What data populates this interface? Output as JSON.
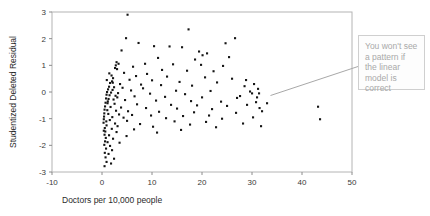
{
  "chart_data": {
    "type": "scatter",
    "title": "",
    "xlabel": "Doctors per 10,000 people",
    "ylabel": "Studentized Deleted Residual",
    "xlim": [
      -10,
      50
    ],
    "ylim": [
      -3,
      3
    ],
    "xticks": [
      "-10",
      "0",
      "10",
      "20",
      "30",
      "40",
      "50"
    ],
    "yticks": [
      "-3",
      "-2",
      "-1",
      "0",
      "1",
      "2",
      "3"
    ],
    "xtick_values": [
      -10,
      0,
      10,
      20,
      30,
      40,
      50
    ],
    "ytick_values": [
      -3,
      -2,
      -1,
      0,
      1,
      2,
      3
    ],
    "grid": false,
    "legend": null,
    "marker": "square",
    "marker_color": "#151515",
    "frame_color": "#b4b4b4",
    "points": [
      [
        5.1,
        2.9
      ],
      [
        17.3,
        2.35
      ],
      [
        4.8,
        2.02
      ],
      [
        26.6,
        2.02
      ],
      [
        7.3,
        1.84
      ],
      [
        24.7,
        1.83
      ],
      [
        10.4,
        1.72
      ],
      [
        13.5,
        1.71
      ],
      [
        16.0,
        1.68
      ],
      [
        3.9,
        1.56
      ],
      [
        19.4,
        1.52
      ],
      [
        21.0,
        1.45
      ],
      [
        20.1,
        1.38
      ],
      [
        25.4,
        1.31
      ],
      [
        11.2,
        1.28
      ],
      [
        18.6,
        1.22
      ],
      [
        2.9,
        1.12
      ],
      [
        3.3,
        1.06
      ],
      [
        8.6,
        1.06
      ],
      [
        14.2,
        1.04
      ],
      [
        19.8,
        1.02
      ],
      [
        24.2,
        0.98
      ],
      [
        6.2,
        0.95
      ],
      [
        2.6,
        0.9
      ],
      [
        3.0,
        0.86
      ],
      [
        12.0,
        0.83
      ],
      [
        17.0,
        0.8
      ],
      [
        22.3,
        0.78
      ],
      [
        4.4,
        0.72
      ],
      [
        9.0,
        0.68
      ],
      [
        1.9,
        0.62
      ],
      [
        6.8,
        0.6
      ],
      [
        13.0,
        0.58
      ],
      [
        20.6,
        0.55
      ],
      [
        2.2,
        0.52
      ],
      [
        26.0,
        0.5
      ],
      [
        5.5,
        0.46
      ],
      [
        10.0,
        0.44
      ],
      [
        2.0,
        0.4
      ],
      [
        15.5,
        0.38
      ],
      [
        23.0,
        0.36
      ],
      [
        1.6,
        0.34
      ],
      [
        3.6,
        0.3
      ],
      [
        7.8,
        0.28
      ],
      [
        11.8,
        0.26
      ],
      [
        18.0,
        0.24
      ],
      [
        28.5,
        0.22
      ],
      [
        1.4,
        0.2
      ],
      [
        2.4,
        0.18
      ],
      [
        4.1,
        0.16
      ],
      [
        8.2,
        0.14
      ],
      [
        30.4,
        0.3
      ],
      [
        31.2,
        0.12
      ],
      [
        1.2,
        0.1
      ],
      [
        2.1,
        0.08
      ],
      [
        5.8,
        0.06
      ],
      [
        14.8,
        0.05
      ],
      [
        21.7,
        0.04
      ],
      [
        29.6,
        0.02
      ],
      [
        1.0,
        0.0
      ],
      [
        1.8,
        -0.02
      ],
      [
        3.2,
        -0.04
      ],
      [
        9.6,
        -0.06
      ],
      [
        16.6,
        -0.08
      ],
      [
        30.0,
        -0.05
      ],
      [
        0.9,
        -0.1
      ],
      [
        1.5,
        -0.12
      ],
      [
        2.7,
        -0.14
      ],
      [
        6.5,
        -0.16
      ],
      [
        12.6,
        -0.18
      ],
      [
        20.0,
        -0.2
      ],
      [
        27.0,
        -0.22
      ],
      [
        31.0,
        -0.2
      ],
      [
        0.8,
        -0.24
      ],
      [
        1.3,
        -0.26
      ],
      [
        2.3,
        -0.28
      ],
      [
        4.6,
        -0.3
      ],
      [
        10.8,
        -0.32
      ],
      [
        17.8,
        -0.34
      ],
      [
        23.8,
        -0.36
      ],
      [
        30.8,
        -0.38
      ],
      [
        0.7,
        -0.4
      ],
      [
        1.1,
        -0.42
      ],
      [
        2.5,
        -0.44
      ],
      [
        7.0,
        -0.46
      ],
      [
        13.8,
        -0.48
      ],
      [
        19.0,
        -0.5
      ],
      [
        25.0,
        -0.52
      ],
      [
        29.0,
        -0.48
      ],
      [
        0.6,
        -0.54
      ],
      [
        1.7,
        -0.56
      ],
      [
        3.8,
        -0.58
      ],
      [
        8.8,
        -0.6
      ],
      [
        15.0,
        -0.62
      ],
      [
        22.0,
        -0.64
      ],
      [
        31.5,
        -0.6
      ],
      [
        0.5,
        -0.66
      ],
      [
        1.05,
        -0.68
      ],
      [
        2.8,
        -0.7
      ],
      [
        5.2,
        -0.72
      ],
      [
        11.4,
        -0.74
      ],
      [
        18.4,
        -0.76
      ],
      [
        26.8,
        -0.78
      ],
      [
        32.0,
        -0.72
      ],
      [
        0.45,
        -0.8
      ],
      [
        1.25,
        -0.82
      ],
      [
        3.4,
        -0.84
      ],
      [
        6.0,
        -0.86
      ],
      [
        9.8,
        -0.88
      ],
      [
        16.2,
        -0.9
      ],
      [
        21.4,
        -0.88
      ],
      [
        0.4,
        -0.92
      ],
      [
        2.05,
        -0.94
      ],
      [
        4.3,
        -0.96
      ],
      [
        12.8,
        -0.98
      ],
      [
        24.0,
        -1.0
      ],
      [
        30.2,
        -0.95
      ],
      [
        0.35,
        -1.02
      ],
      [
        1.55,
        -1.05
      ],
      [
        5.0,
        -1.08
      ],
      [
        14.5,
        -1.1
      ],
      [
        20.8,
        -1.12
      ],
      [
        43.2,
        -0.55
      ],
      [
        43.6,
        -1.02
      ],
      [
        0.3,
        -1.15
      ],
      [
        2.6,
        -1.18
      ],
      [
        7.6,
        -1.2
      ],
      [
        17.6,
        -1.22
      ],
      [
        28.2,
        -1.18
      ],
      [
        0.9,
        -1.25
      ],
      [
        3.1,
        -1.28
      ],
      [
        10.2,
        -1.3
      ],
      [
        22.8,
        -1.32
      ],
      [
        31.8,
        -1.28
      ],
      [
        0.55,
        -1.35
      ],
      [
        1.95,
        -1.38
      ],
      [
        6.4,
        -1.4
      ],
      [
        15.8,
        -1.42
      ],
      [
        0.65,
        -1.48
      ],
      [
        2.9,
        -1.5
      ],
      [
        11.0,
        -1.52
      ],
      [
        0.5,
        -1.6
      ],
      [
        1.4,
        -1.62
      ],
      [
        4.9,
        -1.65
      ],
      [
        0.75,
        -1.72
      ],
      [
        2.2,
        -1.75
      ],
      [
        0.6,
        -1.85
      ],
      [
        1.1,
        -1.88
      ],
      [
        3.5,
        -1.9
      ],
      [
        0.45,
        -1.98
      ],
      [
        1.6,
        -2.02
      ],
      [
        0.8,
        -2.12
      ],
      [
        2.0,
        -2.18
      ],
      [
        0.55,
        -2.28
      ],
      [
        1.3,
        -2.32
      ],
      [
        0.7,
        -2.45
      ],
      [
        2.4,
        -2.5
      ],
      [
        0.9,
        -2.62
      ],
      [
        1.8,
        -2.68
      ],
      [
        0.5,
        -2.78
      ],
      [
        0.35,
        -1.45
      ],
      [
        1.15,
        -0.35
      ],
      [
        2.15,
        0.35
      ],
      [
        0.95,
        0.45
      ],
      [
        3.05,
        -0.2
      ],
      [
        1.45,
        0.7
      ],
      [
        0.85,
        -1.1
      ],
      [
        2.75,
        1.0
      ],
      [
        27.6,
        -0.15
      ],
      [
        28.8,
        0.45
      ],
      [
        31.4,
        -0.05
      ],
      [
        33.0,
        -0.42
      ]
    ]
  },
  "annotation": {
    "text": "You won't see a pattern if the linear model is correct",
    "text_color": "#a9a9a9",
    "border_color": "#cfcfcf",
    "background_color": "#fdfdfd",
    "leader_color": "#a8a8a8"
  }
}
